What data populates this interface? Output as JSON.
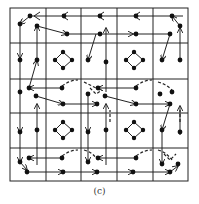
{
  "figure": {
    "caption": "(c)",
    "grid": {
      "rows": 5,
      "cols": 5,
      "x_lines": [
        10,
        46,
        81,
        117,
        153,
        188
      ],
      "y_lines": [
        8,
        43,
        79,
        113,
        148,
        181
      ],
      "stroke": "#222222"
    },
    "node_color": "#111111",
    "edge_color": "#222222"
  }
}
